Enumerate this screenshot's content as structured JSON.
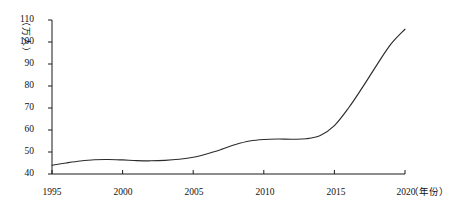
{
  "chart_data": {
    "type": "line",
    "title": "",
    "subtitle": "",
    "xlabel": "（年份）",
    "ylabel": "（万人）",
    "xlim": [
      1995,
      2020
    ],
    "ylim": [
      40,
      110
    ],
    "grid": false,
    "legend": null,
    "x_ticks": [
      "1995",
      "2000",
      "2005",
      "2010",
      "2015",
      "2020"
    ],
    "x_tick_values": [
      1995,
      2000,
      2005,
      2010,
      2015,
      2020
    ],
    "y_ticks": [
      "40",
      "50",
      "60",
      "70",
      "80",
      "90",
      "100",
      "110"
    ],
    "y_tick_values": [
      40,
      50,
      60,
      70,
      80,
      90,
      100,
      110
    ],
    "series": [
      {
        "name": "人数",
        "x": [
          1995,
          1996,
          1997,
          1998,
          1999,
          2000,
          2001,
          2002,
          2003,
          2004,
          2005,
          2006,
          2007,
          2008,
          2009,
          2010,
          2011,
          2012,
          2013,
          2014,
          2015,
          2016,
          2017,
          2018,
          2019,
          2020
        ],
        "values": [
          44.0,
          45.0,
          45.9,
          46.5,
          46.6,
          46.4,
          46.1,
          46.0,
          46.2,
          46.7,
          47.6,
          49.2,
          51.2,
          53.4,
          55.0,
          55.7,
          55.9,
          55.8,
          56.0,
          57.5,
          62.0,
          70.0,
          79.5,
          89.5,
          99.0,
          105.8
        ]
      }
    ],
    "annotations": []
  },
  "axis": {
    "y_unit_chars": [
      "（",
      "万",
      "人",
      "）"
    ],
    "x_unit": "（年份）"
  },
  "colors": {
    "line": "#2b2b2b",
    "axis": "#1a1a1a",
    "background": "#ffffff"
  }
}
